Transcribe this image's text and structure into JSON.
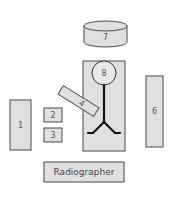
{
  "diagram": {
    "type": "room-layout",
    "colors": {
      "fill": "#e0e0e0",
      "stroke": "#4a4a4a",
      "figure": "#111111",
      "text": "#555555"
    },
    "items": [
      {
        "id": "1",
        "label": "1",
        "shape": "rect"
      },
      {
        "id": "2",
        "label": "2",
        "shape": "rect"
      },
      {
        "id": "3",
        "label": "3",
        "shape": "rect"
      },
      {
        "id": "4",
        "label": "4",
        "shape": "rotated-rect"
      },
      {
        "id": "6",
        "label": "6",
        "shape": "rect"
      },
      {
        "id": "7",
        "label": "7",
        "shape": "cylinder"
      },
      {
        "id": "8",
        "label": "8",
        "shape": "circle-head"
      },
      {
        "id": "radiographer",
        "label": "Radiographer",
        "shape": "rect"
      }
    ]
  }
}
